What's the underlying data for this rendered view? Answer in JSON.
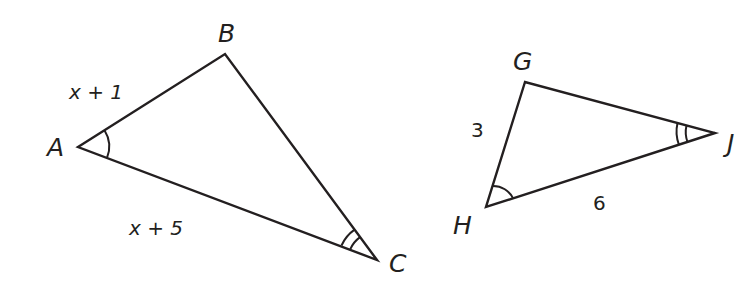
{
  "figure": {
    "triangle_abc": {
      "vertices": {
        "A": {
          "label": "A",
          "x": 78,
          "y": 147
        },
        "B": {
          "label": "B",
          "x": 225,
          "y": 54
        },
        "C": {
          "label": "C",
          "x": 377,
          "y": 260
        }
      },
      "sides": {
        "AB": "x + 1",
        "AC": "x + 5"
      },
      "angle_marks": {
        "A": "single arc",
        "C": "double arc"
      }
    },
    "triangle_ghj": {
      "vertices": {
        "G": {
          "label": "G",
          "x": 525,
          "y": 82
        },
        "H": {
          "label": "H",
          "x": 486,
          "y": 207
        },
        "J": {
          "label": "J",
          "x": 715,
          "y": 133
        }
      },
      "sides": {
        "GH": "3",
        "HJ": "6"
      },
      "angle_marks": {
        "H": "single arc",
        "J": "double arc"
      },
      "note": "Vertex J label is cropped at the right edge"
    }
  }
}
